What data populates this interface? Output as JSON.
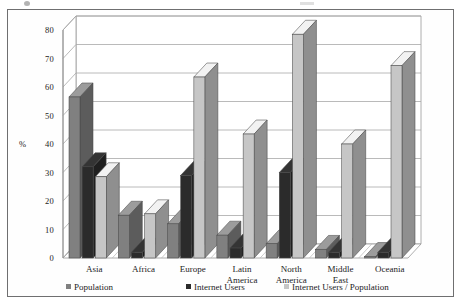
{
  "figure": {
    "has_border": true,
    "background": "#fefefe"
  },
  "chart_data": {
    "type": "bar",
    "title": "",
    "subtitle": "",
    "xlabel": "",
    "ylabel": "%",
    "ylim": [
      0,
      80
    ],
    "ytick_values": [
      0,
      10,
      20,
      30,
      40,
      50,
      60,
      70,
      80
    ],
    "ytick_labels": [
      "0",
      "10",
      "20",
      "30",
      "40",
      "50",
      "60",
      "70",
      "80"
    ],
    "grid": true,
    "grid_axis": "y",
    "legend_position": "bottom",
    "style": "3d-column",
    "categories": [
      "Asia",
      "Africa",
      "Europe",
      "Latin America",
      "North America",
      "Middle East",
      "Oceania"
    ],
    "category_lines": [
      [
        "Asia"
      ],
      [
        "Africa"
      ],
      [
        "Europe"
      ],
      [
        "Latin",
        "America"
      ],
      [
        "North",
        "America"
      ],
      [
        "Middle",
        "East"
      ],
      [
        "Oceania"
      ]
    ],
    "series": [
      {
        "name": "Population",
        "color": "#808080",
        "values": [
          56.5,
          15.0,
          12.0,
          8.0,
          5.0,
          3.0,
          0.5
        ]
      },
      {
        "name": "Internet Users",
        "color": "#2b2b2b",
        "values": [
          32.0,
          2.0,
          29.0,
          3.5,
          30.0,
          2.0,
          2.0
        ]
      },
      {
        "name": "Internet Users / Population",
        "color": "#c6c6c6",
        "values": [
          28.5,
          15.5,
          63.5,
          43.5,
          78.5,
          40.0,
          67.5
        ]
      }
    ]
  },
  "legend": {
    "items": [
      {
        "label": "Population",
        "color": "#808080"
      },
      {
        "label": "Internet Users",
        "color": "#2b2b2b"
      },
      {
        "label": "Internet Users / Population",
        "color": "#c6c6c6"
      }
    ]
  }
}
